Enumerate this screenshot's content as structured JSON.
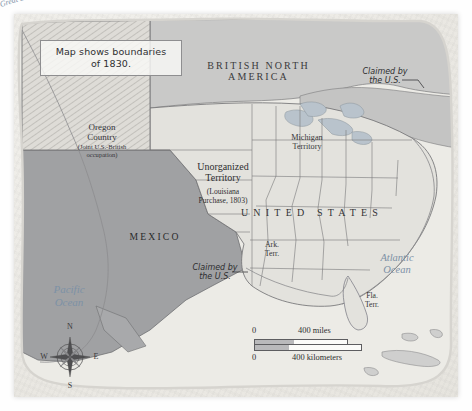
{
  "map": {
    "caption": {
      "line1": "Map shows boundaries",
      "line2": "of 1830."
    },
    "labels": {
      "british_north_america": "BRITISH NORTH\nAMERICA",
      "oregon_title": "Oregon\nCountry",
      "oregon_sub": "(Joint U.S.-British\noccupation)",
      "unorganized_title": "Unorganized\nTerritory",
      "unorganized_sub": "(Louisiana\nPurchase, 1803)",
      "michigan_territory": "Michigan\nTerritory",
      "united_states": "UNITED STATES",
      "mexico": "MEXICO",
      "arkansas_territory": "Ark.\nTerr.",
      "florida_territory": "Fla.\nTerr.",
      "claimed_northeast": "Claimed by\nthe U.S.",
      "claimed_texas": "Claimed by\nthe U.S.",
      "pacific_ocean": "Pacific\nOcean",
      "atlantic_ocean": "Atlantic\nOcean",
      "great_lakes": "Great Lakes"
    },
    "compass": {
      "north": "N",
      "east": "E",
      "south": "S",
      "west": "W"
    },
    "scale": {
      "zero_top": "0",
      "miles": "400 miles",
      "zero_bottom": "0",
      "kilometers": "400 kilometers"
    },
    "colors": {
      "paper": "#eceae5",
      "united_states_fill": "#e3e2dd",
      "mexico_fill": "#a0a1a3",
      "british_fill": "#c9c9c8",
      "ocean_label": "#7d91a6",
      "boundary": "#6e6e70"
    }
  }
}
